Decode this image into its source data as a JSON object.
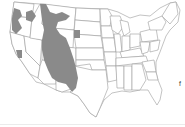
{
  "map": {
    "type": "choropleth-range",
    "region": "Contiguous United States",
    "shaded_region_description": "Western range: Rocky Mountain and Great Basin states (ID, MT, WY, UT, CO, NV, AZ, NM) plus patches in WA, OR, CA, and western SD",
    "colors": {
      "range_fill": "#8a8a8a",
      "state_fill": "#ffffff",
      "state_border": "#9a9a9a",
      "background": "#ffffff"
    },
    "edge_mark": "f"
  }
}
